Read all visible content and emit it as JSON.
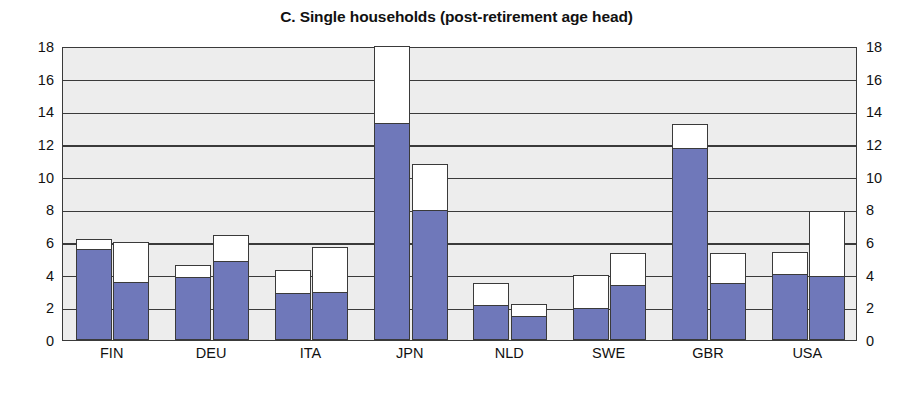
{
  "chart_data": {
    "type": "bar",
    "title": "C. Single households (post-retirement age head)",
    "xlabel": "",
    "ylabel": "",
    "ylim": [
      0,
      18
    ],
    "yticks": [
      0,
      2,
      4,
      6,
      8,
      10,
      12,
      14,
      16,
      18
    ],
    "ytick_labels": [
      "0",
      "2",
      "4",
      "6",
      "8",
      "10",
      "12",
      "14",
      "16",
      "18"
    ],
    "grid": true,
    "legend": "none",
    "stacked": true,
    "dual_axis": true,
    "right_axis_ticks": [
      0,
      2,
      4,
      6,
      8,
      10,
      12,
      14,
      16,
      18
    ],
    "right_axis_tick_labels": [
      "0",
      "2",
      "4",
      "6",
      "8",
      "10",
      "12",
      "14",
      "16",
      "18"
    ],
    "categories": [
      "FIN",
      "DEU",
      "ITA",
      "JPN",
      "NLD",
      "SWE",
      "GBR",
      "USA"
    ],
    "bars_per_category": 2,
    "series": [
      {
        "name": "filled-lower-segment",
        "color": "#6f78ba",
        "bar1_values": [
          5.5,
          3.8,
          2.8,
          13.2,
          2.1,
          1.9,
          11.7,
          4.0
        ],
        "bar2_values": [
          3.5,
          4.8,
          2.9,
          7.9,
          1.4,
          3.3,
          3.4,
          3.85
        ]
      },
      {
        "name": "open-upper-segment",
        "color": "#ffffff",
        "bar1_totals": [
          6.2,
          4.6,
          4.3,
          18.0,
          3.5,
          4.0,
          13.2,
          5.4
        ],
        "bar2_totals": [
          6.0,
          6.4,
          5.7,
          10.8,
          2.2,
          5.3,
          5.3,
          7.9
        ]
      }
    ],
    "colors": {
      "fill": "#6f78ba",
      "open": "#ffffff",
      "outline": "#3a3a3a",
      "plot_background": "#ededed",
      "page_background": "#ffffff",
      "text": "#111111"
    }
  }
}
